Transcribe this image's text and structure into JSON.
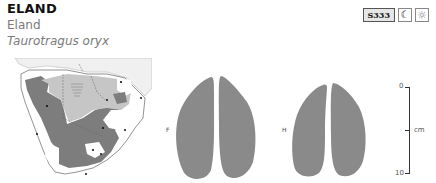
{
  "header": {
    "title": "ELAND",
    "common_name": "Eland",
    "latin_name": "Taurotragus oryx"
  },
  "badges": {
    "code": "S333",
    "activity_icons": [
      "moon-icon",
      "sun-icon"
    ],
    "moon_glyph": "☾",
    "sun_glyph": "☼"
  },
  "map": {
    "region": "Southern Africa distribution map",
    "colors": {
      "background": "#f2f2f2",
      "land": "#ffffff",
      "range_dark": "#7d7d7d",
      "range_light": "#c6c6c6",
      "border": "#777777"
    }
  },
  "tracks": {
    "front": {
      "label": "F",
      "color": "#8a8a8a"
    },
    "hind": {
      "label": "H",
      "color": "#8a8a8a"
    }
  },
  "scale": {
    "min_label": "0",
    "max_label": "10",
    "unit_label": "cm"
  }
}
